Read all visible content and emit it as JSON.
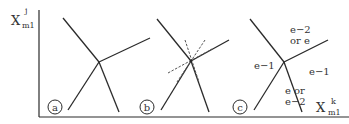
{
  "axes": {
    "y_label": {
      "base": "X",
      "sup": "j",
      "sub": "m1"
    },
    "x_label": {
      "base": "X",
      "sup": "k",
      "sub": "m1"
    }
  },
  "panels": [
    {
      "id": "a",
      "label": "a",
      "junction": [
        99,
        62
      ],
      "lines": [
        [
          [
            63,
            18
          ],
          [
            99,
            62
          ]
        ],
        [
          [
            99,
            62
          ],
          [
            119,
            112
          ]
        ],
        [
          [
            99,
            62
          ],
          [
            68,
            110
          ]
        ],
        [
          [
            99,
            62
          ],
          [
            150,
            38
          ]
        ]
      ],
      "dashed": [],
      "region_labels": []
    },
    {
      "id": "b",
      "label": "b",
      "junction": [
        191,
        61
      ],
      "lines": [
        [
          [
            157,
            19
          ],
          [
            191,
            61
          ]
        ],
        [
          [
            191,
            61
          ],
          [
            209,
            112
          ]
        ],
        [
          [
            191,
            61
          ],
          [
            161,
            110
          ]
        ],
        [
          [
            191,
            61
          ],
          [
            229,
            40
          ]
        ]
      ],
      "dashed": [
        [
          [
            185,
            40
          ],
          [
            199,
            82
          ]
        ],
        [
          [
            205,
            40
          ],
          [
            177,
            82
          ]
        ],
        [
          [
            168,
            73
          ],
          [
            212,
            49
          ]
        ]
      ],
      "region_labels": []
    },
    {
      "id": "c",
      "label": "c",
      "junction": [
        284,
        62
      ],
      "lines": [
        [
          [
            250,
            19
          ],
          [
            284,
            62
          ]
        ],
        [
          [
            284,
            62
          ],
          [
            302,
            112
          ]
        ],
        [
          [
            284,
            62
          ],
          [
            254,
            110
          ]
        ],
        [
          [
            284,
            62
          ],
          [
            328,
            40
          ]
        ]
      ],
      "dashed": [],
      "region_labels": [
        {
          "lines": [
            "e−2",
            "or e"
          ],
          "x": 290,
          "y": 33
        },
        {
          "lines": [
            "e−1"
          ],
          "x": 254,
          "y": 69
        },
        {
          "lines": [
            "e−1"
          ],
          "x": 309,
          "y": 75
        },
        {
          "lines": [
            "e or",
            "e−2"
          ],
          "x": 285,
          "y": 94
        }
      ]
    }
  ],
  "colors": {
    "line": "#2a2a2a",
    "dashed": "#555555",
    "text": "#333333"
  }
}
